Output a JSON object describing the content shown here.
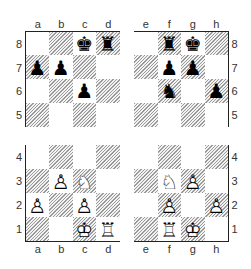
{
  "labels": {
    "files": [
      "a",
      "b",
      "c",
      "d",
      "e",
      "f",
      "g",
      "h"
    ],
    "ranks": [
      "8",
      "7",
      "6",
      "5",
      "4",
      "3",
      "2",
      "1"
    ]
  },
  "board": {
    "c8": "♚",
    "d8": "♜",
    "a7": "♟",
    "b7": "♟",
    "c6": "♟",
    "f8": "♜",
    "g8": "♚",
    "f7": "♟",
    "g7": "♟",
    "f6": "♞",
    "h6": "♟",
    "b3": "♙",
    "c3": "♘",
    "a2": "♙",
    "c2": "♙",
    "c1": "♔",
    "d1": "♖",
    "f3": "♘",
    "g3": "♙",
    "f2": "♙",
    "h2": "♙",
    "f1": "♖",
    "g1": "♔"
  },
  "pieces": [
    {
      "square": "c8",
      "color": "black",
      "type": "king"
    },
    {
      "square": "d8",
      "color": "black",
      "type": "rook"
    },
    {
      "square": "a7",
      "color": "black",
      "type": "pawn"
    },
    {
      "square": "b7",
      "color": "black",
      "type": "pawn"
    },
    {
      "square": "c6",
      "color": "black",
      "type": "pawn"
    },
    {
      "square": "f8",
      "color": "black",
      "type": "rook"
    },
    {
      "square": "g8",
      "color": "black",
      "type": "king"
    },
    {
      "square": "f7",
      "color": "black",
      "type": "pawn"
    },
    {
      "square": "g7",
      "color": "black",
      "type": "pawn"
    },
    {
      "square": "f6",
      "color": "black",
      "type": "knight"
    },
    {
      "square": "h6",
      "color": "black",
      "type": "pawn"
    },
    {
      "square": "b3",
      "color": "white",
      "type": "pawn"
    },
    {
      "square": "c3",
      "color": "white",
      "type": "knight"
    },
    {
      "square": "a2",
      "color": "white",
      "type": "pawn"
    },
    {
      "square": "c2",
      "color": "white",
      "type": "pawn"
    },
    {
      "square": "c1",
      "color": "white",
      "type": "king"
    },
    {
      "square": "d1",
      "color": "white",
      "type": "rook"
    },
    {
      "square": "f3",
      "color": "white",
      "type": "knight"
    },
    {
      "square": "g3",
      "color": "white",
      "type": "pawn"
    },
    {
      "square": "f2",
      "color": "white",
      "type": "pawn"
    },
    {
      "square": "h2",
      "color": "white",
      "type": "pawn"
    },
    {
      "square": "f1",
      "color": "white",
      "type": "rook"
    },
    {
      "square": "g1",
      "color": "white",
      "type": "king"
    }
  ],
  "colors": {
    "border": "#222222",
    "hatch": "#9a9a9a",
    "light_square": "#ffffff",
    "label": "#333333"
  }
}
